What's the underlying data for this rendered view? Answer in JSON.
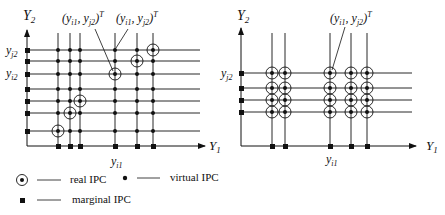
{
  "left_panel": {
    "y_axis_label": "Y",
    "y_axis_sub": "2",
    "x_axis_label": "Y",
    "x_axis_sub": "1",
    "y_tick_labels": [
      {
        "main": "y",
        "sub": "j2"
      },
      {
        "main": "y",
        "sub": "i2"
      }
    ],
    "x_tick_label": {
      "main": "y",
      "sub": "i1"
    },
    "annotations": [
      {
        "text": "(y_i1, y_j2)^T",
        "main": "(y",
        "s1": "i1",
        "mid": ", y",
        "s2": "j2",
        "end": ")",
        "sup": "T"
      },
      {
        "text": "(y_i1, y_j2)^T",
        "main": "(y",
        "s1": "i1",
        "mid": ", y",
        "s2": "j2",
        "end": ")",
        "sup": "T"
      }
    ]
  },
  "right_panel": {
    "y_axis_label": "Y",
    "y_axis_sub": "2",
    "x_axis_label": "Y",
    "x_axis_sub": "1",
    "y_tick_label": {
      "main": "y",
      "sub": "j2"
    },
    "x_tick_label": {
      "main": "y",
      "sub": "i1"
    },
    "annotation": {
      "text": "(y_i1, y_j2)^T",
      "main": "(y",
      "s1": "i1",
      "mid": ", y",
      "s2": "j2",
      "end": ")",
      "sup": "T"
    }
  },
  "legend": {
    "real": "real IPC",
    "virtual": "virtual IPC",
    "marginal": "marginal IPC"
  },
  "colors": {
    "ink": "#111111",
    "background": "#ffffff"
  }
}
